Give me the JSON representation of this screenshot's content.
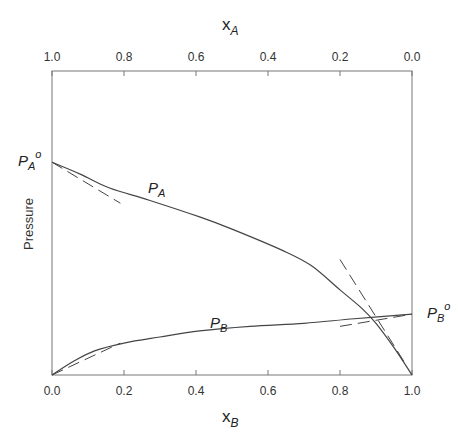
{
  "chart_data": {
    "type": "line",
    "title": "",
    "ylabel": "Pressure",
    "xlabel_bottom": {
      "base": "x",
      "sub": "B"
    },
    "xlabel_top": {
      "base": "x",
      "sub": "A"
    },
    "x_bottom_ticks": [
      "0.0",
      "0.2",
      "0.4",
      "0.6",
      "0.8",
      "1.0"
    ],
    "x_top_ticks": [
      "1.0",
      "0.8",
      "0.6",
      "0.4",
      "0.2",
      "0.0"
    ],
    "xlim": [
      0,
      1
    ],
    "grid": false,
    "y_markers": [
      {
        "label": "P",
        "sub": "A",
        "sup": "o",
        "side": "left",
        "y_frac": 0.7
      },
      {
        "label": "P",
        "sub": "B",
        "sup": "o",
        "side": "right",
        "y_frac": 0.2
      }
    ],
    "series": [
      {
        "name": "P_A",
        "label": {
          "base": "P",
          "sub": "A"
        },
        "style": "solid",
        "x": [
          0.0,
          0.08,
          0.16,
          0.27,
          0.41,
          0.5,
          0.64,
          0.72,
          0.8,
          0.86,
          0.9,
          0.95,
          1.0
        ],
        "y": [
          0.7,
          0.66,
          0.615,
          0.575,
          0.52,
          0.48,
          0.41,
          0.36,
          0.28,
          0.22,
          0.17,
          0.09,
          0.0
        ]
      },
      {
        "name": "P_B",
        "label": {
          "base": "P",
          "sub": "B"
        },
        "style": "solid",
        "x": [
          0.0,
          0.06,
          0.12,
          0.2,
          0.3,
          0.41,
          0.55,
          0.7,
          0.84,
          1.0
        ],
        "y": [
          0.0,
          0.045,
          0.08,
          0.105,
          0.125,
          0.145,
          0.16,
          0.17,
          0.185,
          0.2
        ]
      },
      {
        "name": "Raoult tangent A",
        "style": "dashed",
        "x": [
          0.0,
          0.19
        ],
        "y": [
          0.7,
          0.565
        ]
      },
      {
        "name": "Henry tangent A",
        "style": "dashed",
        "x": [
          0.8,
          0.98
        ],
        "y": [
          0.38,
          0.04
        ]
      },
      {
        "name": "Henry tangent B",
        "style": "dashed",
        "x": [
          0.0,
          0.19
        ],
        "y": [
          0.0,
          0.105
        ]
      },
      {
        "name": "Raoult tangent B",
        "style": "dashed",
        "x": [
          0.8,
          1.0
        ],
        "y": [
          0.16,
          0.2
        ]
      }
    ]
  }
}
